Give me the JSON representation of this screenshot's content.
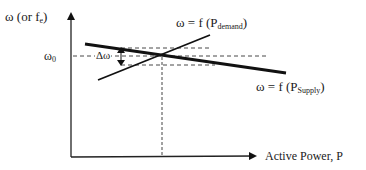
{
  "diagram": {
    "y_axis_label": "ω (or f",
    "y_axis_label_sub": "e",
    "y_axis_label_close": ")",
    "x_axis_label": "Active Power, P",
    "omega0_label": "ω",
    "omega0_sub": "0",
    "delta_omega_label": "Δω",
    "demand_curve_label": "ω = f (P",
    "demand_curve_sub": "demand",
    "demand_curve_close": ")",
    "supply_curve_label": "ω = f (P",
    "supply_curve_sub": "Supply",
    "supply_curve_close": ")",
    "colors": {
      "lines": "#111111",
      "text": "#1a1a1a",
      "background": "#ffffff"
    }
  }
}
